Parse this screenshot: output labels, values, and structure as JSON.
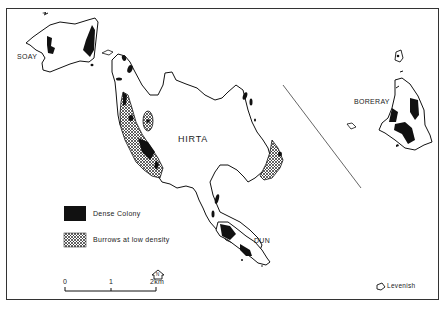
{
  "map": {
    "islands": {
      "soay": "SOAY",
      "hirta": "HIRTA",
      "boreray": "BORERAY",
      "dun": "DUN",
      "levenish": "Levenish"
    },
    "legend": {
      "items": [
        {
          "symbol": "solid-black",
          "label": "Dense Colony"
        },
        {
          "symbol": "cross-hatch",
          "label": "Burrows at low density"
        }
      ]
    },
    "scale_bar": {
      "ticks": [
        "0",
        "1",
        "2km"
      ]
    },
    "north_arrow": {
      "label": "N"
    },
    "colors": {
      "ink": "#111111",
      "background": "#ffffff",
      "hatch": "#222222"
    }
  }
}
